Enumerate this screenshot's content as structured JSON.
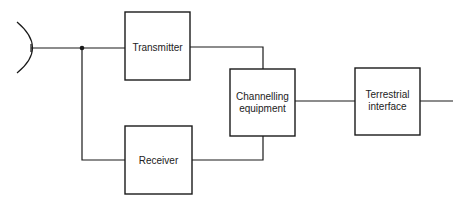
{
  "diagram": {
    "type": "block-diagram",
    "blocks": {
      "transmitter": {
        "lines": [
          "Transmitter"
        ]
      },
      "receiver": {
        "lines": [
          "Receiver"
        ]
      },
      "channelling": {
        "lines": [
          "Channelling",
          "equipment"
        ]
      },
      "terrestrial": {
        "lines": [
          "Terrestrial",
          "interface"
        ]
      }
    },
    "connections": [
      [
        "antenna",
        "transmitter"
      ],
      [
        "antenna",
        "receiver"
      ],
      [
        "transmitter",
        "channelling"
      ],
      [
        "receiver",
        "channelling"
      ],
      [
        "channelling",
        "terrestrial"
      ],
      [
        "terrestrial",
        "output"
      ]
    ],
    "colors": {
      "line": "#1a1a1a",
      "background": "#ffffff"
    }
  }
}
